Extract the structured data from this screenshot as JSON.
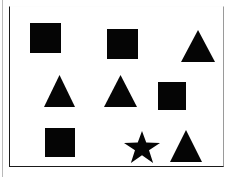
{
  "figure": {
    "title": "",
    "background_color": "#ffffff",
    "shape_color": "#050505",
    "frame_color": "#1a1a1a",
    "frame": {
      "x": 9,
      "y": 6,
      "width": 215,
      "height": 161
    },
    "shape_counts": {
      "square": 4,
      "triangle": 4,
      "star": 1,
      "total": 9
    },
    "rows": 3,
    "columns": 3,
    "shapes": [
      {
        "id": "shape-1",
        "kind": "square",
        "row": 1,
        "column": 1,
        "x": 29,
        "y": 22,
        "width": 31,
        "height": 30,
        "color": "#050505"
      },
      {
        "id": "shape-2",
        "kind": "square",
        "row": 1,
        "column": 2,
        "x": 106,
        "y": 28,
        "width": 31,
        "height": 30,
        "color": "#050505"
      },
      {
        "id": "shape-3",
        "kind": "triangle",
        "row": 1,
        "column": 3,
        "x": 180,
        "y": 29,
        "width": 34,
        "height": 32,
        "color": "#050505"
      },
      {
        "id": "shape-4",
        "kind": "triangle",
        "row": 2,
        "column": 1,
        "x": 43,
        "y": 74,
        "width": 31,
        "height": 32,
        "color": "#050505"
      },
      {
        "id": "shape-5",
        "kind": "triangle",
        "row": 2,
        "column": 2,
        "x": 103,
        "y": 74,
        "width": 33,
        "height": 32,
        "color": "#050505"
      },
      {
        "id": "shape-6",
        "kind": "square",
        "row": 2,
        "column": 3,
        "x": 157,
        "y": 81,
        "width": 28,
        "height": 28,
        "color": "#050505"
      },
      {
        "id": "shape-7",
        "kind": "square",
        "row": 3,
        "column": 1,
        "x": 44,
        "y": 127,
        "width": 30,
        "height": 29,
        "color": "#050505"
      },
      {
        "id": "shape-8",
        "kind": "star",
        "row": 3,
        "column": 2,
        "x": 123,
        "y": 130,
        "width": 36,
        "height": 32,
        "color": "#050505"
      },
      {
        "id": "shape-9",
        "kind": "triangle",
        "row": 3,
        "column": 3,
        "x": 169,
        "y": 129,
        "width": 32,
        "height": 32,
        "color": "#050505"
      }
    ]
  }
}
